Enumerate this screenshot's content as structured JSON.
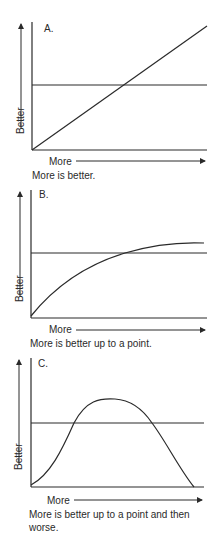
{
  "diagrams": [
    {
      "label": "A.",
      "y_axis_label": "Better",
      "x_axis_label": "More",
      "caption_line1": "More is better.",
      "caption_line2": "",
      "curve": "linear increasing"
    },
    {
      "label": "B.",
      "y_axis_label": "Better",
      "x_axis_label": "More",
      "caption_line1": "More is better up to a point.",
      "caption_line2": "",
      "curve": "increasing with diminishing returns (plateau)"
    },
    {
      "label": "C.",
      "y_axis_label": "Better",
      "x_axis_label": "More",
      "caption_line1": "More is better up to a point and then",
      "caption_line2": "worse.",
      "curve": "inverted U (rises, peaks, falls)"
    }
  ],
  "colors": {
    "ink": "#2a2a2a",
    "background": "#ffffff"
  }
}
